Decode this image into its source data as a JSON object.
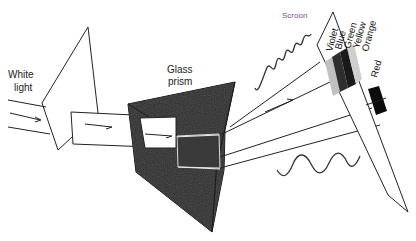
{
  "diagram": {
    "labels": {
      "white_light_line1": "White",
      "white_light_line2": "light",
      "prism_line1": "Glass",
      "prism_line2": "prism",
      "screen": "Scroon"
    },
    "spectrum": [
      {
        "name": "Violet",
        "shade": "#b9b9b9"
      },
      {
        "name": "Blue",
        "shade": "#3a3a3a"
      },
      {
        "name": "Green",
        "shade": "#1e1e1e"
      },
      {
        "name": "Yellow",
        "shade": "#c8c8c8"
      },
      {
        "name": "Orange",
        "shade": "#ffffff"
      },
      {
        "name": "Red",
        "shade": "#0d0d0d"
      }
    ],
    "colors": {
      "prism": "#2a2a2a",
      "line": "#222222",
      "background": "#ffffff",
      "screen_label": "#7a4fa0"
    },
    "waves": [
      {
        "name": "short-wavelength-wave",
        "position": "upper"
      },
      {
        "name": "long-wavelength-wave",
        "position": "lower"
      }
    ]
  }
}
